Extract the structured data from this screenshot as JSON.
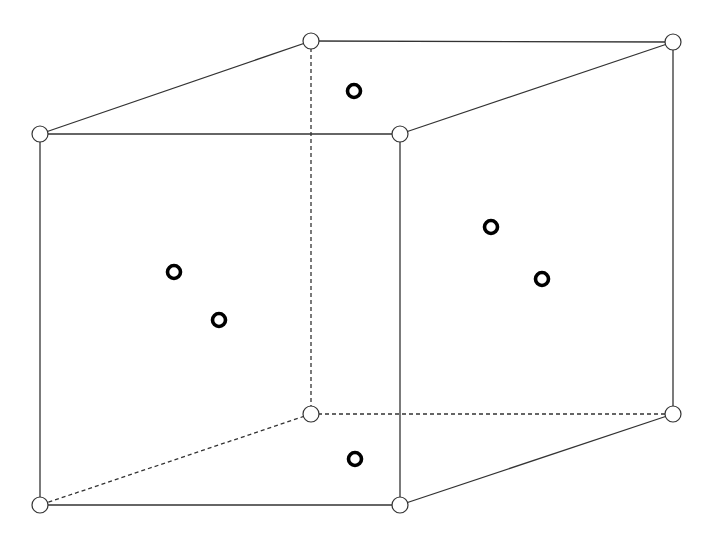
{
  "diagram": {
    "type": "cube-unit-cell",
    "colors": {
      "line": "#333333",
      "background": "#ffffff",
      "corner_fill": "#ffffff",
      "face_atom": "#000000"
    },
    "vertices": [
      {
        "id": "front-top-left",
        "x": 40,
        "y": 134
      },
      {
        "id": "front-top-right",
        "x": 400,
        "y": 134
      },
      {
        "id": "front-bottom-left",
        "x": 40,
        "y": 505
      },
      {
        "id": "front-bottom-right",
        "x": 400,
        "y": 505
      },
      {
        "id": "back-top-left",
        "x": 311,
        "y": 41
      },
      {
        "id": "back-top-right",
        "x": 673,
        "y": 42
      },
      {
        "id": "back-bottom-left",
        "x": 311,
        "y": 414
      },
      {
        "id": "back-bottom-right",
        "x": 673,
        "y": 414
      }
    ],
    "solid_edges": [
      [
        "front-top-left",
        "front-top-right"
      ],
      [
        "front-top-right",
        "front-bottom-right"
      ],
      [
        "front-bottom-right",
        "front-bottom-left"
      ],
      [
        "front-bottom-left",
        "front-top-left"
      ],
      [
        "front-top-left",
        "back-top-left"
      ],
      [
        "back-top-left",
        "back-top-right"
      ],
      [
        "front-top-right",
        "back-top-right"
      ],
      [
        "back-top-right",
        "back-bottom-right"
      ],
      [
        "front-bottom-right",
        "back-bottom-right"
      ]
    ],
    "dashed_edges": [
      [
        "back-top-left",
        "back-bottom-left"
      ],
      [
        "back-bottom-left",
        "back-bottom-right"
      ],
      [
        "back-bottom-left",
        "front-bottom-left"
      ]
    ],
    "face_centers": [
      {
        "face": "top",
        "x": 354,
        "y": 91
      },
      {
        "face": "left",
        "x": 174,
        "y": 272
      },
      {
        "face": "front",
        "x": 219,
        "y": 320
      },
      {
        "face": "back",
        "x": 491,
        "y": 227
      },
      {
        "face": "right",
        "x": 542,
        "y": 279
      },
      {
        "face": "bottom",
        "x": 355,
        "y": 459
      }
    ]
  }
}
